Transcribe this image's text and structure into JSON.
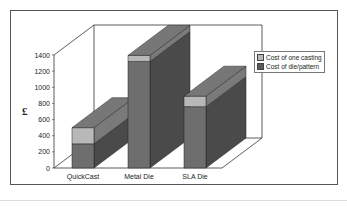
{
  "chart_data": {
    "type": "bar",
    "subtype": "stacked-3d",
    "title": "",
    "xlabel": "",
    "ylabel": "£",
    "ylim": [
      0,
      1400
    ],
    "yticks": [
      0,
      200,
      400,
      600,
      800,
      1000,
      1200,
      1400
    ],
    "categories": [
      "QuickCast",
      "Metal Die",
      "SLA Die"
    ],
    "series": [
      {
        "name": "Cost of die/pattern",
        "values": [
          300,
          1320,
          760
        ],
        "color": "#6e6e6e"
      },
      {
        "name": "Cost of one casting",
        "values": [
          200,
          75,
          130
        ],
        "color": "#b8b8b8"
      }
    ],
    "legend": {
      "position": "right",
      "entries": [
        "Cost of one casting",
        "Cost of die/pattern"
      ]
    },
    "grid": false
  },
  "axis": {
    "y_label": "£",
    "ticks": [
      "0",
      "200",
      "400",
      "600",
      "800",
      "1000",
      "1200",
      "1400"
    ]
  },
  "legend": {
    "items": [
      {
        "label": "Cost of one casting",
        "color": "#b8b8b8"
      },
      {
        "label": "Cost of die/pattern",
        "color": "#5a5a5a"
      }
    ]
  },
  "categories": {
    "c0": "QuickCast",
    "c1": "Metal Die",
    "c2": "SLA Die"
  }
}
